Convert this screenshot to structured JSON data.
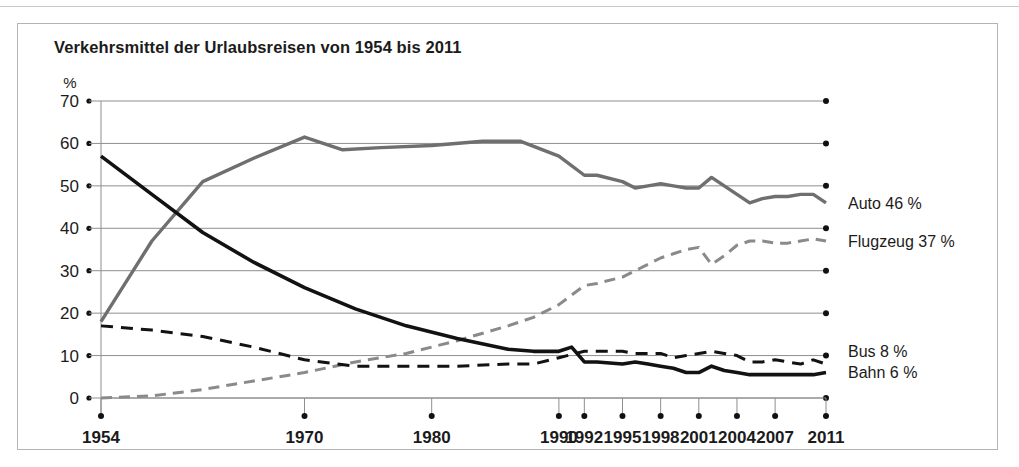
{
  "chart_title": "Verkehrsmittel der Urlaubsreisen von 1954 bis 2011",
  "axis": {
    "unit_label": "%",
    "y_ticks": [
      "70",
      "60",
      "50",
      "40",
      "30",
      "20",
      "10",
      "0"
    ],
    "x_ticks": [
      "1954",
      "1970",
      "1980",
      "1990",
      "1992",
      "1995",
      "1998",
      "2001",
      "2004",
      "2007",
      "2011"
    ]
  },
  "legend": {
    "auto": "Auto 46 %",
    "flugzeug": "Flugzeug 37 %",
    "bus": "Bus 8 %",
    "bahn": "Bahn 6 %"
  },
  "colors": {
    "auto": "#6f6f6f",
    "flugzeug": "#8a8a8a",
    "bus": "#121212",
    "bahn": "#121212",
    "grid": "#8e8e8e",
    "frame": "#b4b4b4",
    "text": "#1b1b1b"
  },
  "chart_data": {
    "type": "line",
    "title": "Verkehrsmittel der Urlaubsreisen von 1954 bis 2011",
    "xlabel": "",
    "ylabel": "%",
    "ylim": [
      0,
      70
    ],
    "xlim": [
      1954,
      2011
    ],
    "grid": true,
    "legend_position": "right-inline",
    "y_ticks": [
      0,
      10,
      20,
      30,
      40,
      50,
      60,
      70
    ],
    "x_tick_labels": [
      1954,
      1970,
      1980,
      1990,
      1992,
      1995,
      1998,
      2001,
      2004,
      2007,
      2011
    ],
    "series": [
      {
        "name": "Auto",
        "style": "solid",
        "color": "#6f6f6f",
        "end_label": "Auto 46 %",
        "end_value": 46,
        "points": [
          [
            1954,
            18
          ],
          [
            1958,
            37
          ],
          [
            1962,
            51
          ],
          [
            1966,
            56.5
          ],
          [
            1970,
            61.5
          ],
          [
            1973,
            58.5
          ],
          [
            1976,
            59
          ],
          [
            1980,
            59.5
          ],
          [
            1984,
            60.5
          ],
          [
            1987,
            60.5
          ],
          [
            1990,
            57
          ],
          [
            1992,
            52.5
          ],
          [
            1993,
            52.5
          ],
          [
            1995,
            51
          ],
          [
            1996,
            49.5
          ],
          [
            1997,
            50
          ],
          [
            1998,
            50.5
          ],
          [
            1999,
            50
          ],
          [
            2000,
            49.5
          ],
          [
            2001,
            49.5
          ],
          [
            2002,
            52
          ],
          [
            2003,
            50
          ],
          [
            2004,
            48
          ],
          [
            2005,
            46
          ],
          [
            2006,
            47
          ],
          [
            2007,
            47.5
          ],
          [
            2008,
            47.5
          ],
          [
            2009,
            48
          ],
          [
            2010,
            48
          ],
          [
            2011,
            46
          ]
        ]
      },
      {
        "name": "Flugzeug",
        "style": "dashed",
        "color": "#8a8a8a",
        "end_label": "Flugzeug 37 %",
        "end_value": 37,
        "points": [
          [
            1954,
            0
          ],
          [
            1958,
            0.5
          ],
          [
            1962,
            2
          ],
          [
            1966,
            4
          ],
          [
            1970,
            6
          ],
          [
            1974,
            8.5
          ],
          [
            1978,
            10.5
          ],
          [
            1982,
            13.5
          ],
          [
            1986,
            17
          ],
          [
            1988,
            19
          ],
          [
            1990,
            22
          ],
          [
            1992,
            26.5
          ],
          [
            1993,
            27
          ],
          [
            1995,
            28.5
          ],
          [
            1996,
            30
          ],
          [
            1997,
            31.5
          ],
          [
            1998,
            33
          ],
          [
            1999,
            34
          ],
          [
            2000,
            35
          ],
          [
            2001,
            35.5
          ],
          [
            2002,
            31.5
          ],
          [
            2003,
            33.5
          ],
          [
            2004,
            36
          ],
          [
            2005,
            37
          ],
          [
            2006,
            37
          ],
          [
            2007,
            36.5
          ],
          [
            2008,
            36.5
          ],
          [
            2009,
            37
          ],
          [
            2010,
            37.5
          ],
          [
            2011,
            37
          ]
        ]
      },
      {
        "name": "Bus",
        "style": "dashed",
        "color": "#121212",
        "end_label": "Bus 8 %",
        "end_value": 8,
        "points": [
          [
            1954,
            17
          ],
          [
            1958,
            16
          ],
          [
            1962,
            14.5
          ],
          [
            1966,
            12
          ],
          [
            1970,
            9
          ],
          [
            1974,
            7.5
          ],
          [
            1978,
            7.5
          ],
          [
            1982,
            7.5
          ],
          [
            1986,
            8
          ],
          [
            1988,
            8
          ],
          [
            1990,
            9.5
          ],
          [
            1992,
            11
          ],
          [
            1993,
            11
          ],
          [
            1995,
            11
          ],
          [
            1996,
            10.5
          ],
          [
            1997,
            10.5
          ],
          [
            1998,
            10.5
          ],
          [
            1999,
            9.5
          ],
          [
            2000,
            10
          ],
          [
            2001,
            10.5
          ],
          [
            2002,
            11
          ],
          [
            2003,
            10.5
          ],
          [
            2004,
            10
          ],
          [
            2005,
            8.5
          ],
          [
            2006,
            8.5
          ],
          [
            2007,
            9
          ],
          [
            2008,
            8.5
          ],
          [
            2009,
            8
          ],
          [
            2010,
            9
          ],
          [
            2011,
            8
          ]
        ]
      },
      {
        "name": "Bahn",
        "style": "solid",
        "color": "#121212",
        "end_label": "Bahn 6 %",
        "end_value": 6,
        "points": [
          [
            1954,
            57
          ],
          [
            1958,
            48
          ],
          [
            1962,
            39
          ],
          [
            1966,
            32
          ],
          [
            1970,
            26
          ],
          [
            1974,
            21
          ],
          [
            1978,
            17
          ],
          [
            1982,
            14
          ],
          [
            1986,
            11.5
          ],
          [
            1988,
            11
          ],
          [
            1990,
            11
          ],
          [
            1991,
            12
          ],
          [
            1992,
            8.5
          ],
          [
            1993,
            8.5
          ],
          [
            1995,
            8
          ],
          [
            1996,
            8.5
          ],
          [
            1997,
            8
          ],
          [
            1998,
            7.5
          ],
          [
            1999,
            7
          ],
          [
            2000,
            6
          ],
          [
            2001,
            6
          ],
          [
            2002,
            7.5
          ],
          [
            2003,
            6.5
          ],
          [
            2004,
            6
          ],
          [
            2005,
            5.5
          ],
          [
            2006,
            5.5
          ],
          [
            2007,
            5.5
          ],
          [
            2008,
            5.5
          ],
          [
            2009,
            5.5
          ],
          [
            2010,
            5.5
          ],
          [
            2011,
            6
          ]
        ]
      }
    ]
  }
}
